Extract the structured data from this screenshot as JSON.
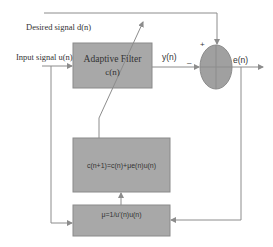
{
  "diagram": {
    "labels": {
      "desired_signal": "Desired signal d(n)",
      "input_signal": "Input signal u(n)",
      "output": "y(n)",
      "error": "e(n)",
      "plus": "+",
      "minus": "–"
    },
    "blocks": {
      "adaptive_filter": {
        "line1": "Adaptive Filter",
        "line2": "c(n)"
      },
      "update_rule": {
        "text": "c(n+1)=c(n)+μe(n)u(n)"
      },
      "step_size": {
        "text": "μ=1/u'(n)u(n)"
      }
    },
    "colors": {
      "block_fill": "#a8a8a8",
      "summer_fill": "#a0a0a0",
      "wire": "#8c8c8c",
      "text": "#333333"
    }
  }
}
